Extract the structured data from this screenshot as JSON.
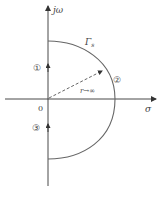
{
  "diagram": {
    "axes": {
      "imag_label": "jω",
      "real_label": "σ",
      "origin_label": "0"
    },
    "contour_label": "Γs",
    "contour_label_main": "Γ",
    "contour_label_sub": "s",
    "radius_label": "r→∞",
    "segments": [
      {
        "id": "1",
        "label": "①"
      },
      {
        "id": "2",
        "label": "②"
      },
      {
        "id": "3",
        "label": "③"
      }
    ],
    "colors": {
      "axis": "#333333",
      "contour": "#666666",
      "dashed": "#555555"
    }
  }
}
